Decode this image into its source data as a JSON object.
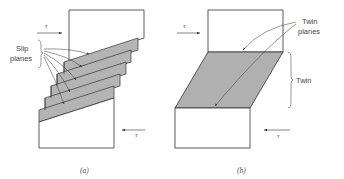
{
  "figure": {
    "panel_a": {
      "caption": "(a)",
      "label_slip_line1": "Slip",
      "label_slip_line2": "planes",
      "tau_top": "τ",
      "tau_bottom": "τ",
      "description": "Slip: crystal shears along multiple parallel slip planes forming a staircase of displaced gray bands"
    },
    "panel_b": {
      "caption": "(b)",
      "label_twin_planes_line1": "Twin",
      "label_twin_planes_line2": "planes",
      "label_twin": "Twin",
      "tau_top": "τ",
      "tau_bottom": "τ",
      "description": "Twinning: a sheared gray parallelogram region (twin) between two twin planes"
    },
    "colors": {
      "band_fill": "#b4b4b4",
      "twin_fill": "#b0b0b0",
      "stroke": "#333333",
      "text": "#444444"
    }
  }
}
